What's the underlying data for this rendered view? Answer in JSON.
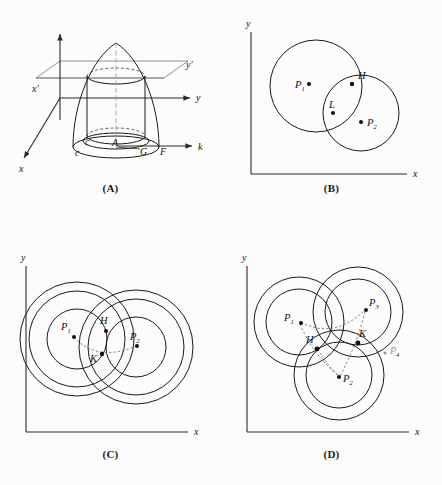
{
  "figure": {
    "background_color": "#fcfcfc",
    "ink_color": "#1a1a1a",
    "panel_count": 4
  },
  "panels": [
    {
      "id": "A",
      "caption": "(A)",
      "description": "three-dimensional paraboloid with inscribed cylinder cut by a horizontal plane",
      "axes": [
        {
          "name": "x",
          "label": "x",
          "direction": "lower-left"
        },
        {
          "name": "y",
          "label": "y",
          "direction": "right"
        },
        {
          "name": "z",
          "label": "",
          "direction": "up"
        },
        {
          "name": "k",
          "label": "k",
          "direction": "lower-right"
        }
      ],
      "plane_labels": [
        {
          "name": "x-prime",
          "label": "x′"
        },
        {
          "name": "y-prime",
          "label": "y′"
        }
      ],
      "point_labels": [
        {
          "name": "c-inner",
          "label": "c"
        },
        {
          "name": "c-outer",
          "label": "c"
        },
        {
          "name": "A",
          "label": "A"
        },
        {
          "name": "G",
          "label": "G"
        },
        {
          "name": "F",
          "label": "F"
        }
      ]
    },
    {
      "id": "B",
      "caption": "(B)",
      "description": "two overlapping circles in the x-y plane",
      "axes": [
        {
          "name": "y",
          "label": "y"
        },
        {
          "name": "x",
          "label": "x"
        }
      ],
      "circles": [
        {
          "name": "circle-p1",
          "cx": 95,
          "cy": 86,
          "r": 46
        },
        {
          "name": "circle-p2",
          "cx": 140,
          "cy": 113,
          "r": 38
        }
      ],
      "points": [
        {
          "name": "P1",
          "label": "P",
          "sub": "1",
          "x": 88,
          "y": 84
        },
        {
          "name": "P2",
          "label": "P",
          "sub": "2",
          "x": 146,
          "y": 122
        },
        {
          "name": "H",
          "label": "H",
          "x": 131,
          "y": 84
        },
        {
          "name": "L",
          "label": "L",
          "x": 112,
          "y": 111
        }
      ]
    },
    {
      "id": "C",
      "caption": "(C)",
      "description": "two concentric annuli whose rings intersect at H and K",
      "axes": [
        {
          "name": "y",
          "label": "y"
        },
        {
          "name": "x",
          "label": "x"
        }
      ],
      "annuli": [
        {
          "name": "annulus-p1",
          "cx": 77,
          "cy": 97,
          "r_inner": 30,
          "r_outer": 57
        },
        {
          "name": "annulus-p2",
          "cx": 136,
          "cy": 105,
          "r_inner": 30,
          "r_outer": 57
        }
      ],
      "points": [
        {
          "name": "P1",
          "label": "P",
          "sub": "1",
          "x": 73,
          "y": 93
        },
        {
          "name": "P2",
          "label": "P",
          "sub": "2",
          "x": 137,
          "y": 103
        },
        {
          "name": "H",
          "label": "H",
          "x": 106,
          "y": 89
        },
        {
          "name": "K",
          "label": "K",
          "x": 101,
          "y": 112
        }
      ]
    },
    {
      "id": "D",
      "caption": "(D)",
      "description": "three concentric annuli meeting near H and K with a faint fourth-point annotation",
      "axes": [
        {
          "name": "y",
          "label": "y"
        },
        {
          "name": "x",
          "label": "x"
        }
      ],
      "annuli": [
        {
          "name": "annulus-p1",
          "cx": 78,
          "cy": 80,
          "r_inner": 33,
          "r_outer": 45
        },
        {
          "name": "annulus-p3",
          "cx": 137,
          "cy": 70,
          "r_inner": 33,
          "r_outer": 45
        },
        {
          "name": "annulus-p2",
          "cx": 118,
          "cy": 133,
          "r_inner": 33,
          "r_outer": 45
        }
      ],
      "points": [
        {
          "name": "P1",
          "label": "P",
          "sub": "1",
          "x": 79,
          "y": 80
        },
        {
          "name": "P2",
          "label": "P",
          "sub": "2",
          "x": 119,
          "y": 136
        },
        {
          "name": "P3",
          "label": "P",
          "sub": "3",
          "x": 146,
          "y": 66
        },
        {
          "name": "H",
          "label": "H",
          "x": 97,
          "y": 105
        },
        {
          "name": "K",
          "label": "K",
          "x": 137,
          "y": 100
        }
      ],
      "annotation": {
        "name": "P4-handwritten",
        "label": "P",
        "sub": "4",
        "color": "#9a9a9a"
      }
    }
  ]
}
